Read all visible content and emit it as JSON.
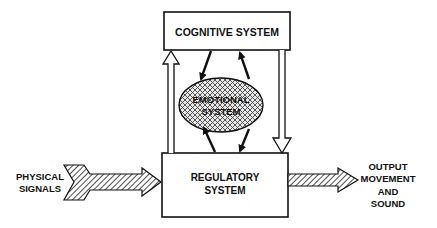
{
  "diagram": {
    "nodes": {
      "cognitive": {
        "label": "COGNITIVE SYSTEM"
      },
      "emotional": {
        "label_line1": "EMOTIONAL",
        "label_line2": "SYSTEM"
      },
      "regulatory": {
        "label_line1": "REGULATORY",
        "label_line2": "SYSTEM"
      }
    },
    "input": {
      "label_line1": "PHYSICAL",
      "label_line2": "SIGNALS"
    },
    "output": {
      "label_line1": "OUTPUT",
      "label_line2": "MOVEMENT",
      "label_line3": "AND",
      "label_line4": "SOUND"
    },
    "edges": [
      {
        "from": "physical-signals",
        "to": "regulatory",
        "style": "hatched-arrow"
      },
      {
        "from": "regulatory",
        "to": "output",
        "style": "hatched-arrow"
      },
      {
        "from": "regulatory",
        "to": "cognitive",
        "style": "hollow-arrow"
      },
      {
        "from": "cognitive",
        "to": "regulatory",
        "style": "hollow-arrow"
      },
      {
        "from": "cognitive",
        "to": "emotional",
        "style": "solid-arrow"
      },
      {
        "from": "emotional",
        "to": "cognitive",
        "style": "solid-arrow"
      },
      {
        "from": "regulatory",
        "to": "emotional",
        "style": "solid-arrow"
      },
      {
        "from": "emotional",
        "to": "regulatory",
        "style": "solid-arrow"
      }
    ],
    "colors": {
      "stroke": "#111111",
      "background": "#ffffff"
    }
  }
}
